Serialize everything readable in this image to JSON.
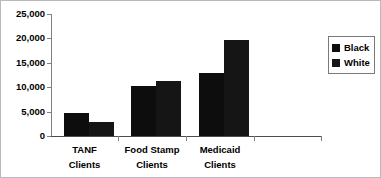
{
  "chart_data": {
    "type": "bar",
    "title": "",
    "xlabel": "",
    "ylabel": "",
    "categories": [
      "TANF Clients",
      "Food Stamp Clients",
      "Medicaid Clients"
    ],
    "category_lines": [
      [
        "TANF",
        "Clients"
      ],
      [
        "Food Stamp",
        "Clients"
      ],
      [
        "Medicaid",
        "Clients"
      ]
    ],
    "series": [
      {
        "name": "Black",
        "values": [
          4800,
          10200,
          13000
        ],
        "color": "#0d0d0d"
      },
      {
        "name": "White",
        "values": [
          2900,
          11300,
          19600
        ],
        "color": "#151515"
      }
    ],
    "ylim": [
      0,
      25000
    ],
    "ytick_values": [
      0,
      5000,
      10000,
      15000,
      20000,
      25000
    ],
    "ytick_labels": [
      "0",
      "5,000",
      "10,000",
      "15,000",
      "20,000",
      "25,000"
    ],
    "grid": false,
    "legend_position": "right"
  },
  "legend": {
    "entries": [
      {
        "label": "Black",
        "swatch": "legend-swatch-black"
      },
      {
        "label": "White",
        "swatch": "legend-swatch-white"
      }
    ]
  }
}
